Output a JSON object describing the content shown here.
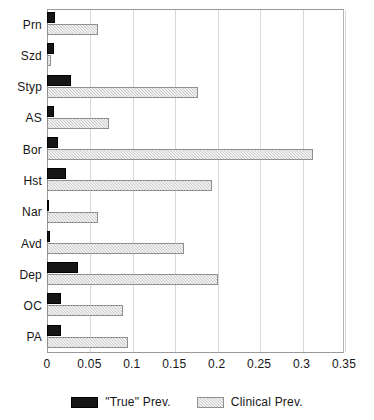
{
  "chart_data": {
    "type": "bar",
    "orientation": "horizontal",
    "title": "",
    "xlabel": "",
    "ylabel": "",
    "xlim": [
      0,
      0.35
    ],
    "ylim": null,
    "grid": true,
    "gridlines_axis": "x",
    "legend_position": "bottom-center",
    "xticks": [
      "0",
      "0.05",
      "0.1",
      "0.15",
      "0.2",
      "0.25",
      "0.3",
      "0.35"
    ],
    "xtick_values": [
      0,
      0.05,
      0.1,
      0.15,
      0.2,
      0.25,
      0.3,
      0.35
    ],
    "categories": [
      "Prn",
      "Szd",
      "Styp",
      "AS",
      "Bor",
      "Hst",
      "Nar",
      "Avd",
      "Dep",
      "OC",
      "PA"
    ],
    "series": [
      {
        "name": "\"True\" Prev.",
        "color": "#161616",
        "values": [
          0.009,
          0.008,
          0.028,
          0.008,
          0.013,
          0.022,
          0.001,
          0.004,
          0.036,
          0.016,
          0.016
        ]
      },
      {
        "name": "Clinical Prev.",
        "color": "#c9c9c9",
        "values": [
          0.06,
          0.005,
          0.178,
          0.073,
          0.313,
          0.194,
          0.06,
          0.161,
          0.201,
          0.09,
          0.096
        ]
      }
    ]
  },
  "legend": {
    "items": [
      {
        "label": "\"True\" Prev."
      },
      {
        "label": "Clinical Prev."
      }
    ]
  }
}
